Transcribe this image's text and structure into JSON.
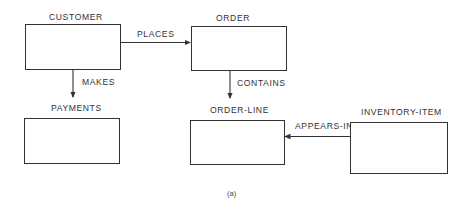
{
  "diagram": {
    "type": "entity-relationship",
    "caption": "(a)",
    "entities": [
      {
        "id": "customer",
        "label": "CUSTOMER"
      },
      {
        "id": "order",
        "label": "ORDER"
      },
      {
        "id": "payments",
        "label": "PAYMENTS"
      },
      {
        "id": "order_line",
        "label": "ORDER-LINE"
      },
      {
        "id": "inventory_item",
        "label": "INVENTORY-ITEM"
      }
    ],
    "relationships": [
      {
        "from": "CUSTOMER",
        "to": "ORDER",
        "label": "PLACES"
      },
      {
        "from": "CUSTOMER",
        "to": "PAYMENTS",
        "label": "MAKES"
      },
      {
        "from": "ORDER",
        "to": "ORDER-LINE",
        "label": "CONTAINS"
      },
      {
        "from": "INVENTORY-ITEM",
        "to": "ORDER-LINE",
        "label": "APPEARS-IN"
      }
    ],
    "line_color": "#333333"
  }
}
